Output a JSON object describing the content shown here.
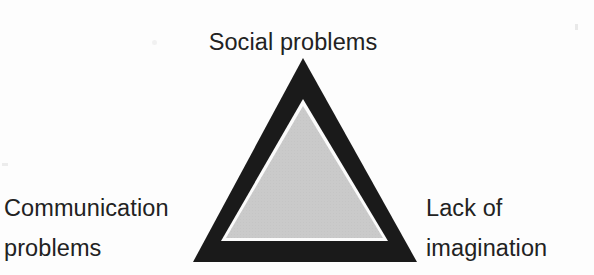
{
  "diagram": {
    "type": "triangle",
    "title_visible": false,
    "colors": {
      "background": "#fdfdfd",
      "outer_triangle_fill": "#1a1a1a",
      "gap_stroke": "#ffffff",
      "inner_triangle_fill": "#cacaca",
      "text": "#222222"
    },
    "geometry": {
      "outer_apex": [
        303,
        58
      ],
      "outer_base_left": [
        193,
        262
      ],
      "outer_base_right": [
        417,
        262
      ],
      "inner_apex": [
        303,
        105
      ],
      "inner_base_left": [
        228,
        238
      ],
      "inner_base_right": [
        382,
        238
      ]
    },
    "vertices": [
      {
        "position": "top",
        "label": "Social problems",
        "lines": [
          "Social problems"
        ]
      },
      {
        "position": "bottom-left",
        "label": "Communication problems",
        "lines": [
          "Communication",
          "problems"
        ]
      },
      {
        "position": "bottom-right",
        "label": "Lack of imagination",
        "lines": [
          "Lack of",
          "imagination"
        ]
      }
    ]
  },
  "labels": {
    "top": {
      "line1": "Social problems"
    },
    "left": {
      "line1": "Communication",
      "line2": "problems"
    },
    "right": {
      "line1": "Lack of",
      "line2": "imagination"
    }
  }
}
